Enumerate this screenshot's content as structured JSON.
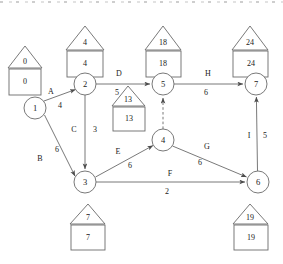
{
  "diagram": {
    "type": "activity-on-arrow-network",
    "stroke_color": "#4d4d4d",
    "text_color": "#1a1a1a",
    "background_color": "#ffffff"
  },
  "nodes": [
    {
      "id": "1",
      "label": "1",
      "cx": 35,
      "cy": 108,
      "r": 11
    },
    {
      "id": "2",
      "label": "2",
      "cx": 85,
      "cy": 84,
      "r": 11
    },
    {
      "id": "3",
      "label": "3",
      "cx": 85,
      "cy": 182,
      "r": 11
    },
    {
      "id": "4",
      "label": "4",
      "cx": 163,
      "cy": 140,
      "r": 11
    },
    {
      "id": "5",
      "label": "5",
      "cx": 163,
      "cy": 84,
      "r": 11
    },
    {
      "id": "6",
      "label": "6",
      "cx": 258,
      "cy": 182,
      "r": 11
    },
    {
      "id": "7",
      "label": "7",
      "cx": 256,
      "cy": 84,
      "r": 11
    }
  ],
  "tags": [
    {
      "node": "1",
      "earliest": "0",
      "latest": "0",
      "x": 25,
      "y": 52,
      "pos": "left"
    },
    {
      "node": "2",
      "earliest": "4",
      "latest": "4",
      "x": 85,
      "y": 34,
      "pos": "above"
    },
    {
      "node": "3",
      "earliest": "7",
      "latest": "7",
      "x": 88,
      "y": 231,
      "pos": "below"
    },
    {
      "node": "4",
      "earliest": "13",
      "latest": "13",
      "x": 128,
      "y": 112,
      "pos": "left"
    },
    {
      "node": "5",
      "earliest": "18",
      "latest": "18",
      "x": 163,
      "y": 34,
      "pos": "above"
    },
    {
      "node": "6",
      "earliest": "19",
      "latest": "19",
      "x": 250,
      "y": 231,
      "pos": "below"
    },
    {
      "node": "7",
      "earliest": "24",
      "latest": "24",
      "x": 250,
      "y": 34,
      "pos": "above"
    }
  ],
  "edges": [
    {
      "id": "A",
      "from": "1",
      "to": "2",
      "activity": "A",
      "duration": "4",
      "activity_pos": {
        "x": 51,
        "y": 92
      },
      "duration_pos": {
        "x": 60,
        "y": 106
      },
      "style": "solid"
    },
    {
      "id": "B",
      "from": "1",
      "to": "3",
      "activity": "B",
      "duration": "6",
      "activity_pos": {
        "x": 40,
        "y": 159
      },
      "duration_pos": {
        "x": 57,
        "y": 150
      },
      "style": "solid"
    },
    {
      "id": "C",
      "from": "2",
      "to": "3",
      "activity": "C",
      "duration": "3",
      "activity_pos": {
        "x": 74,
        "y": 130
      },
      "duration_pos": {
        "x": 95,
        "y": 130
      },
      "style": "solid"
    },
    {
      "id": "D",
      "from": "2",
      "to": "5",
      "activity": "D",
      "duration": "5",
      "activity_pos": {
        "x": 119,
        "y": 74
      },
      "duration_pos": {
        "x": 117,
        "y": 93
      },
      "style": "solid"
    },
    {
      "id": "E",
      "from": "3",
      "to": "4",
      "activity": "E",
      "duration": "6",
      "activity_pos": {
        "x": 118,
        "y": 152
      },
      "duration_pos": {
        "x": 130,
        "y": 166
      },
      "style": "solid"
    },
    {
      "id": "F",
      "from": "3",
      "to": "6",
      "activity": "F",
      "duration": "2",
      "activity_pos": {
        "x": 170,
        "y": 174
      },
      "duration_pos": {
        "x": 167,
        "y": 192
      },
      "style": "solid"
    },
    {
      "id": "G",
      "from": "4",
      "to": "6",
      "activity": "G",
      "duration": "6",
      "activity_pos": {
        "x": 207,
        "y": 147
      },
      "duration_pos": {
        "x": 200,
        "y": 163
      },
      "style": "solid"
    },
    {
      "id": "H",
      "from": "5",
      "to": "7",
      "activity": "H",
      "duration": "6",
      "activity_pos": {
        "x": 208,
        "y": 74
      },
      "duration_pos": {
        "x": 206,
        "y": 93
      },
      "style": "solid"
    },
    {
      "id": "I",
      "from": "6",
      "to": "7",
      "activity": "I",
      "duration": "5",
      "activity_pos": {
        "x": 249,
        "y": 136
      },
      "duration_pos": {
        "x": 265,
        "y": 136
      },
      "style": "solid"
    },
    {
      "id": "dummy-4-5",
      "from": "4",
      "to": "5",
      "activity": "",
      "duration": "",
      "activity_pos": null,
      "duration_pos": null,
      "style": "dashed"
    }
  ]
}
